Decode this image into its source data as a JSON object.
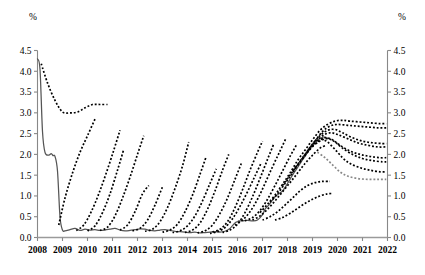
{
  "chart_data": {
    "type": "line",
    "title": "",
    "subtitle": "",
    "xlabel": "",
    "ylabel": "%",
    "ylabel_right": "%",
    "unit_label": "%",
    "xlim": [
      2008,
      2022
    ],
    "ylim": [
      0.0,
      4.5
    ],
    "grid": false,
    "legend": "none",
    "y_ticks": [
      "0.0",
      "0.5",
      "1.0",
      "1.5",
      "2.0",
      "2.5",
      "3.0",
      "3.5",
      "4.0",
      "4.5"
    ],
    "y_tick_values": [
      0.0,
      0.5,
      1.0,
      1.5,
      2.0,
      2.5,
      3.0,
      3.5,
      4.0,
      4.5
    ],
    "x_ticks": [
      "2008",
      "2009",
      "2010",
      "2011",
      "2012",
      "2013",
      "2014",
      "2015",
      "2016",
      "2017",
      "2018",
      "2019",
      "2020",
      "2021",
      "2022"
    ],
    "x_tick_values": [
      2008,
      2009,
      2010,
      2011,
      2012,
      2013,
      2014,
      2015,
      2016,
      2017,
      2018,
      2019,
      2020,
      2021,
      2022
    ],
    "series": [
      {
        "name": "actual-policy-rate",
        "style": "solid",
        "color": "#555555",
        "x": [
          2008.0,
          2008.1,
          2008.2,
          2008.3,
          2008.45,
          2008.55,
          2008.62,
          2008.7,
          2008.8,
          2008.9,
          2009.0,
          2009.1,
          2009.3,
          2009.5,
          2009.7,
          2009.9,
          2010.1,
          2010.3,
          2010.5,
          2010.7,
          2010.9,
          2011.1,
          2011.3,
          2011.5,
          2011.7,
          2011.9,
          2012.1,
          2012.3,
          2012.5,
          2012.7,
          2012.9,
          2013.1,
          2013.3,
          2013.5,
          2013.7,
          2013.9,
          2014.1,
          2014.3,
          2014.5,
          2014.7,
          2014.9,
          2015.1,
          2015.3,
          2015.5,
          2015.7,
          2015.9,
          2016.0,
          2016.05,
          2016.2,
          2016.4,
          2016.6,
          2016.8,
          2017.0,
          2017.1,
          2017.25,
          2017.4,
          2017.5,
          2017.65,
          2017.8,
          2017.95,
          2018.1,
          2018.25,
          2018.4,
          2018.55,
          2018.7,
          2018.85,
          2019.0,
          2019.15,
          2019.3,
          2019.45,
          2019.55,
          2019.65
        ],
        "y": [
          4.3,
          4.05,
          2.55,
          2.05,
          1.98,
          2.02,
          1.97,
          1.95,
          1.6,
          0.5,
          0.18,
          0.16,
          0.19,
          0.22,
          0.17,
          0.2,
          0.18,
          0.19,
          0.17,
          0.18,
          0.2,
          0.22,
          0.18,
          0.16,
          0.17,
          0.19,
          0.21,
          0.2,
          0.17,
          0.16,
          0.18,
          0.19,
          0.17,
          0.15,
          0.14,
          0.13,
          0.12,
          0.13,
          0.11,
          0.12,
          0.13,
          0.14,
          0.13,
          0.15,
          0.22,
          0.35,
          0.38,
          0.4,
          0.4,
          0.41,
          0.4,
          0.42,
          0.55,
          0.68,
          0.78,
          0.9,
          0.98,
          1.05,
          1.12,
          1.25,
          1.4,
          1.55,
          1.68,
          1.82,
          1.95,
          2.1,
          2.22,
          2.32,
          2.38,
          2.42,
          2.4,
          2.38
        ]
      },
      {
        "name": "projection-2008",
        "style": "dashed",
        "color": "#000000",
        "x": [
          2008.15,
          2008.4,
          2008.7,
          2009.0,
          2009.3,
          2009.6,
          2009.9,
          2010.2,
          2010.5,
          2010.8
        ],
        "y": [
          4.18,
          3.72,
          3.3,
          3.02,
          3.0,
          3.02,
          3.12,
          3.2,
          3.2,
          3.2
        ]
      },
      {
        "name": "projection-2009",
        "style": "dashed",
        "color": "#000000",
        "x": [
          2008.85,
          2009.1,
          2009.4,
          2009.7,
          2010.0,
          2010.3
        ],
        "y": [
          0.3,
          0.95,
          1.55,
          2.05,
          2.45,
          2.85
        ]
      },
      {
        "name": "projection-2010a",
        "style": "dashed",
        "color": "#000000",
        "x": [
          2009.55,
          2009.85,
          2010.15,
          2010.45,
          2010.75,
          2011.05,
          2011.3
        ],
        "y": [
          0.17,
          0.3,
          0.62,
          1.05,
          1.55,
          2.1,
          2.58
        ]
      },
      {
        "name": "projection-2010b",
        "style": "dashed",
        "color": "#000000",
        "x": [
          2010.0,
          2010.3,
          2010.6,
          2010.9,
          2011.2,
          2011.45
        ],
        "y": [
          0.16,
          0.28,
          0.6,
          1.05,
          1.62,
          2.12
        ]
      },
      {
        "name": "projection-2011a",
        "style": "dashed",
        "color": "#000000",
        "x": [
          2010.5,
          2010.8,
          2011.1,
          2011.4,
          2011.7,
          2012.0,
          2012.25
        ],
        "y": [
          0.17,
          0.25,
          0.52,
          0.95,
          1.45,
          2.0,
          2.45
        ]
      },
      {
        "name": "projection-2011b",
        "style": "dashed",
        "color": "#000000",
        "x": [
          2011.3,
          2011.6,
          2011.9,
          2012.2,
          2012.45
        ],
        "y": [
          0.18,
          0.3,
          0.62,
          1.05,
          1.25
        ]
      },
      {
        "name": "projection-2012a",
        "style": "dashed",
        "color": "#000000",
        "x": [
          2011.8,
          2012.1,
          2012.4,
          2012.7,
          2013.0
        ],
        "y": [
          0.16,
          0.22,
          0.42,
          0.78,
          1.22
        ]
      },
      {
        "name": "projection-2012b",
        "style": "dashed",
        "color": "#000000",
        "x": [
          2012.3,
          2012.6,
          2012.9,
          2013.2,
          2013.5,
          2013.8,
          2014.05
        ],
        "y": [
          0.15,
          0.2,
          0.38,
          0.72,
          1.18,
          1.72,
          2.3
        ]
      },
      {
        "name": "projection-2013",
        "style": "dashed",
        "color": "#000000",
        "x": [
          2013.0,
          2013.3,
          2013.6,
          2013.9,
          2014.2,
          2014.5,
          2014.75
        ],
        "y": [
          0.13,
          0.18,
          0.32,
          0.62,
          1.02,
          1.52,
          1.95
        ]
      },
      {
        "name": "projection-2014a",
        "style": "dashed",
        "color": "#000000",
        "x": [
          2013.9,
          2014.2,
          2014.5,
          2014.8,
          2015.1,
          2015.4,
          2015.65
        ],
        "y": [
          0.12,
          0.18,
          0.35,
          0.68,
          1.12,
          1.62,
          2.0
        ]
      },
      {
        "name": "projection-2014b",
        "style": "dashed",
        "color": "#000000",
        "x": [
          2014.4,
          2014.7,
          2015.0,
          2015.3,
          2015.6,
          2015.9,
          2016.15
        ],
        "y": [
          0.11,
          0.16,
          0.3,
          0.58,
          0.95,
          1.4,
          1.78
        ]
      },
      {
        "name": "projection-2015a",
        "style": "dashed",
        "color": "#000000",
        "x": [
          2015.0,
          2015.3,
          2015.6,
          2015.9,
          2016.2,
          2016.5,
          2016.8,
          2017.0
        ],
        "y": [
          0.13,
          0.2,
          0.38,
          0.72,
          1.15,
          1.62,
          2.05,
          2.32
        ]
      },
      {
        "name": "projection-2015b",
        "style": "dashed",
        "color": "#000000",
        "x": [
          2015.4,
          2015.7,
          2016.0,
          2016.3,
          2016.6,
          2016.9,
          2017.2,
          2017.45
        ],
        "y": [
          0.12,
          0.18,
          0.32,
          0.6,
          0.98,
          1.42,
          1.88,
          2.25
        ]
      },
      {
        "name": "projection-2016a",
        "style": "dashed",
        "color": "#000000",
        "x": [
          2015.9,
          2016.2,
          2016.5,
          2016.8,
          2017.1,
          2017.4,
          2017.7,
          2017.95
        ],
        "y": [
          0.3,
          0.42,
          0.62,
          0.92,
          1.3,
          1.7,
          2.08,
          2.4
        ]
      },
      {
        "name": "projection-2016b",
        "style": "dashed",
        "color": "#000000",
        "x": [
          2016.3,
          2016.6,
          2016.9,
          2017.2,
          2017.5,
          2017.8,
          2018.1,
          2018.35
        ],
        "y": [
          0.4,
          0.48,
          0.65,
          0.92,
          1.25,
          1.6,
          1.95,
          2.22
        ]
      },
      {
        "name": "projection-2017a",
        "style": "dashed",
        "color": "#000000",
        "x": [
          2016.9,
          2017.2,
          2017.5,
          2017.8,
          2018.1,
          2018.4,
          2018.7,
          2019.0,
          2019.3,
          2019.6,
          2019.9,
          2020.2,
          2020.5,
          2020.9,
          2021.3,
          2021.7,
          2021.95
        ],
        "y": [
          0.6,
          0.8,
          1.02,
          1.28,
          1.55,
          1.85,
          2.1,
          2.35,
          2.58,
          2.72,
          2.8,
          2.82,
          2.8,
          2.78,
          2.76,
          2.74,
          2.74
        ]
      },
      {
        "name": "projection-2017b",
        "style": "dashed",
        "color": "#000000",
        "x": [
          2017.3,
          2017.6,
          2017.9,
          2018.2,
          2018.5,
          2018.8,
          2019.1,
          2019.4,
          2019.7,
          2020.0,
          2020.4,
          2020.8,
          2021.2,
          2021.6,
          2021.95
        ],
        "y": [
          0.85,
          1.05,
          1.3,
          1.55,
          1.82,
          2.08,
          2.32,
          2.55,
          2.68,
          2.72,
          2.7,
          2.68,
          2.66,
          2.64,
          2.64
        ]
      },
      {
        "name": "projection-2018a",
        "style": "dashed",
        "color": "#000000",
        "x": [
          2017.8,
          2018.1,
          2018.4,
          2018.7,
          2019.0,
          2019.3,
          2019.6,
          2019.9,
          2020.2,
          2020.6,
          2021.0,
          2021.4,
          2021.8,
          2021.95
        ],
        "y": [
          1.25,
          1.5,
          1.75,
          2.0,
          2.25,
          2.45,
          2.58,
          2.6,
          2.52,
          2.4,
          2.32,
          2.28,
          2.26,
          2.26
        ]
      },
      {
        "name": "projection-2018b",
        "style": "dashed",
        "color": "#000000",
        "x": [
          2018.2,
          2018.5,
          2018.8,
          2019.1,
          2019.4,
          2019.7,
          2020.0,
          2020.4,
          2020.8,
          2021.2,
          2021.6,
          2021.95
        ],
        "y": [
          1.6,
          1.82,
          2.05,
          2.28,
          2.45,
          2.52,
          2.48,
          2.38,
          2.28,
          2.22,
          2.18,
          2.18
        ]
      },
      {
        "name": "projection-2019a",
        "style": "dashed",
        "color": "#000000",
        "x": [
          2018.6,
          2018.9,
          2019.2,
          2019.5,
          2019.8,
          2020.1,
          2020.5,
          2020.9,
          2021.3,
          2021.7,
          2021.95
        ],
        "y": [
          1.9,
          2.12,
          2.3,
          2.4,
          2.35,
          2.22,
          2.08,
          2.0,
          1.95,
          1.92,
          1.92
        ]
      },
      {
        "name": "projection-2019b",
        "style": "dashed",
        "color": "#000000",
        "x": [
          2019.0,
          2019.3,
          2019.6,
          2019.9,
          2020.2,
          2020.6,
          2021.0,
          2021.4,
          2021.8,
          2021.95
        ],
        "y": [
          2.2,
          2.32,
          2.38,
          2.3,
          2.15,
          2.0,
          1.9,
          1.85,
          1.82,
          1.82
        ]
      },
      {
        "name": "projection-2019c",
        "style": "dashed",
        "color": "#000000",
        "x": [
          2019.35,
          2019.6,
          2019.9,
          2020.2,
          2020.5,
          2020.9,
          2021.3,
          2021.7,
          2021.95
        ],
        "y": [
          2.38,
          2.3,
          2.12,
          1.92,
          1.78,
          1.68,
          1.62,
          1.58,
          1.58
        ]
      },
      {
        "name": "projection-2019d",
        "style": "dashed",
        "color": "#888888",
        "x": [
          2019.2,
          2019.5,
          2019.8,
          2020.1,
          2020.4,
          2020.8,
          2021.2,
          2021.6,
          2021.95
        ],
        "y": [
          2.05,
          1.92,
          1.75,
          1.58,
          1.48,
          1.42,
          1.4,
          1.4,
          1.4
        ]
      },
      {
        "name": "projection-short-2016c",
        "style": "dashed",
        "color": "#000000",
        "x": [
          2016.6,
          2016.9,
          2017.2,
          2017.5,
          2017.8,
          2018.1,
          2018.4,
          2018.7,
          2019.0,
          2019.3,
          2019.55
        ],
        "y": [
          0.42,
          0.52,
          0.68,
          0.88,
          1.1,
          1.32,
          1.55,
          1.78,
          1.98,
          2.15,
          2.22
        ]
      },
      {
        "name": "projection-short-2016d",
        "style": "dashed",
        "color": "#000000",
        "x": [
          2017.0,
          2017.3,
          2017.6,
          2017.9,
          2018.2,
          2018.5,
          2018.8,
          2019.1,
          2019.4,
          2019.7
        ],
        "y": [
          0.42,
          0.5,
          0.62,
          0.78,
          0.95,
          1.12,
          1.25,
          1.32,
          1.35,
          1.35
        ]
      },
      {
        "name": "projection-short-2017c",
        "style": "dashed",
        "color": "#000000",
        "x": [
          2017.5,
          2017.8,
          2018.1,
          2018.4,
          2018.7,
          2019.0,
          2019.3,
          2019.6,
          2019.8
        ],
        "y": [
          0.42,
          0.48,
          0.58,
          0.7,
          0.82,
          0.92,
          1.0,
          1.05,
          1.06
        ]
      },
      {
        "name": "projection-2014c",
        "style": "dashed",
        "color": "#000000",
        "x": [
          2014.9,
          2015.2,
          2015.5,
          2015.8,
          2016.1,
          2016.4,
          2016.7,
          2016.95
        ],
        "y": [
          0.1,
          0.14,
          0.24,
          0.45,
          0.75,
          1.1,
          1.48,
          1.8
        ]
      },
      {
        "name": "projection-2013b",
        "style": "dashed",
        "color": "#000000",
        "x": [
          2013.4,
          2013.7,
          2014.0,
          2014.3,
          2014.6,
          2014.9,
          2015.15
        ],
        "y": [
          0.12,
          0.16,
          0.28,
          0.52,
          0.88,
          1.3,
          1.65
        ]
      }
    ]
  }
}
